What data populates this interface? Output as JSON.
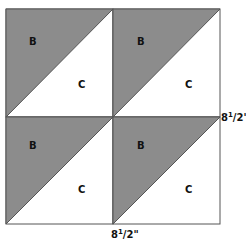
{
  "diagram": {
    "type": "quilt-block",
    "grid": {
      "rows": 2,
      "cols": 2
    },
    "colors": {
      "shaded": "#8c8c8c",
      "unshaded": "#ffffff",
      "stroke": "#555555"
    },
    "cells": [
      {
        "row": 0,
        "col": 0,
        "shaded_label": "B",
        "unshaded_label": "C"
      },
      {
        "row": 0,
        "col": 1,
        "shaded_label": "B",
        "unshaded_label": "C"
      },
      {
        "row": 1,
        "col": 0,
        "shaded_label": "B",
        "unshaded_label": "C"
      },
      {
        "row": 1,
        "col": 1,
        "shaded_label": "B",
        "unshaded_label": "C"
      }
    ],
    "dimensions": {
      "right": {
        "whole": "8",
        "num": "1",
        "den": "2",
        "unit": "\""
      },
      "bottom": {
        "whole": "8",
        "num": "1",
        "den": "2",
        "unit": "\""
      }
    }
  }
}
